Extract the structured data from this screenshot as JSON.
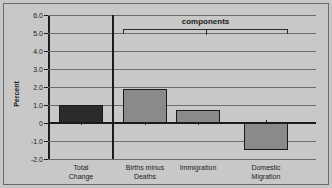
{
  "chart_data": {
    "type": "bar",
    "title": "",
    "xlabel": "",
    "ylabel": "Percent",
    "categories": [
      "Total Change",
      "Births minus Deaths",
      "Immigration",
      "Domestic Migration"
    ],
    "values": [
      1.0,
      1.9,
      0.7,
      -1.5
    ],
    "ylim": [
      -2.0,
      6.0
    ],
    "ytick_labels": [
      "6.0",
      "5.0",
      "4.0",
      "3.0",
      "2.0",
      "1.0",
      "0",
      "-1.0",
      "-2.0"
    ],
    "ytick_values": [
      6.0,
      5.0,
      4.0,
      3.0,
      2.0,
      1.0,
      0,
      -1.0,
      -2.0
    ],
    "grid": true,
    "legend": "none",
    "annotations": [
      {
        "label": "components",
        "covers": [
          "Births minus Deaths",
          "Immigration",
          "Domestic Migration"
        ]
      }
    ],
    "series_colors": {
      "total": "#2b2b2b",
      "components": "#8a8a8a"
    },
    "background_color": "#c8c8c8",
    "axis_color": "#1b1b1b",
    "gridline_color": "#6d6d6d"
  },
  "axis": {
    "y_title": "Percent"
  },
  "bars": [
    {
      "label_line1": "Total",
      "label_line2": "Change",
      "value": 1.0,
      "color": "#2b2b2b"
    },
    {
      "label_line1": "Births minus",
      "label_line2": "Deaths",
      "value": 1.9,
      "color": "#8a8a8a"
    },
    {
      "label_line1": "Immigration",
      "label_line2": "",
      "value": 0.7,
      "color": "#8a8a8a"
    },
    {
      "label_line1": "Domestic",
      "label_line2": "Migration",
      "value": -1.5,
      "color": "#8a8a8a"
    }
  ],
  "annotation": {
    "bracket_label": "components"
  },
  "yticks": [
    {
      "label": "6.0"
    },
    {
      "label": "5.0"
    },
    {
      "label": "4.0"
    },
    {
      "label": "3.0"
    },
    {
      "label": "2.0"
    },
    {
      "label": "1.0"
    },
    {
      "label": "0"
    },
    {
      "label": "-1.0"
    },
    {
      "label": "-2.0"
    }
  ]
}
